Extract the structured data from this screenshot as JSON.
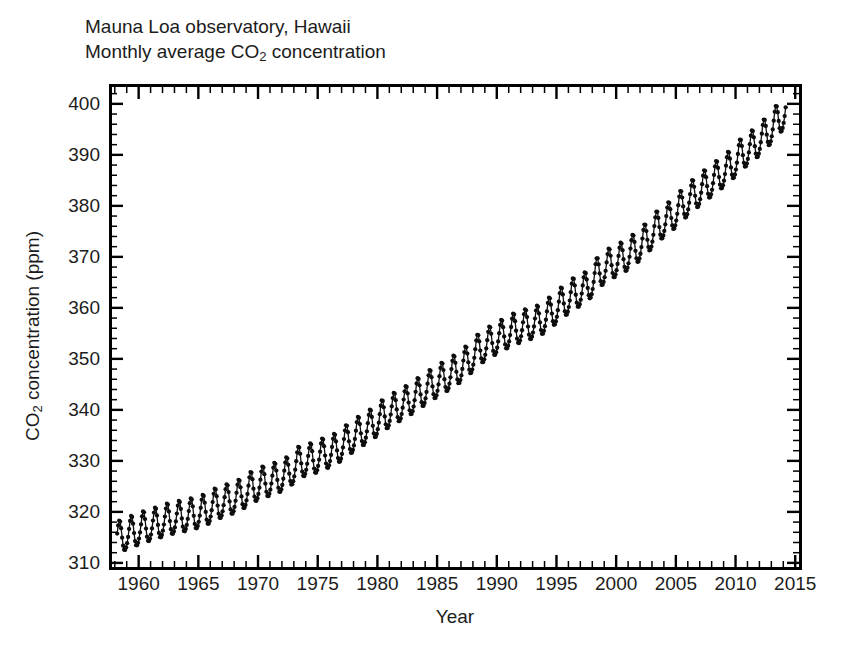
{
  "figure": {
    "title_lines": [
      "Mauna Loa observatory, Hawaii",
      "Monthly average CO2 concentration"
    ],
    "title_line_1": "Mauna Loa observatory, Hawaii",
    "title_line_2_prefix": "Monthly average CO",
    "title_line_2_sub": "2",
    "title_line_2_suffix": " concentration",
    "background_color": "#ffffff",
    "data_color": "#0d0d0d",
    "axis_color": "#000000"
  },
  "chart_data": {
    "type": "line",
    "xlabel": "Year",
    "ylabel": "CO2 concentration (ppm)",
    "ylabel_prefix": "CO",
    "ylabel_sub": "2",
    "ylabel_suffix": " concentration (ppm)",
    "xlim": [
      1957.6,
      2015.4
    ],
    "ylim": [
      309.0,
      403.5
    ],
    "grid": false,
    "legend": null,
    "marker": "filled-circle",
    "y_major_ticks": [
      310,
      320,
      330,
      340,
      350,
      360,
      370,
      380,
      390,
      400
    ],
    "y_tick_labels": [
      "310",
      "320",
      "330",
      "340",
      "350",
      "360",
      "370",
      "380",
      "390",
      "400"
    ],
    "y_minor_step": 2,
    "x_major_ticks": [
      1960,
      1965,
      1970,
      1975,
      1980,
      1985,
      1990,
      1995,
      2000,
      2005,
      2010,
      2015
    ],
    "x_tick_labels": [
      "1960",
      "1965",
      "1970",
      "1975",
      "1980",
      "1985",
      "1990",
      "1995",
      "2000",
      "2005",
      "2010",
      "2015"
    ],
    "x_minor_step": 1,
    "series_name": "Monthly average CO2",
    "annual_trend": [
      {
        "year": 1958.5,
        "value": 315.0
      },
      {
        "year": 1959.5,
        "value": 315.9
      },
      {
        "year": 1960.5,
        "value": 316.8
      },
      {
        "year": 1961.5,
        "value": 317.5
      },
      {
        "year": 1962.5,
        "value": 318.3
      },
      {
        "year": 1963.5,
        "value": 318.8
      },
      {
        "year": 1964.5,
        "value": 319.3
      },
      {
        "year": 1965.5,
        "value": 320.0
      },
      {
        "year": 1966.5,
        "value": 321.3
      },
      {
        "year": 1967.5,
        "value": 322.1
      },
      {
        "year": 1968.5,
        "value": 323.0
      },
      {
        "year": 1969.5,
        "value": 324.6
      },
      {
        "year": 1970.5,
        "value": 325.6
      },
      {
        "year": 1971.5,
        "value": 326.3
      },
      {
        "year": 1972.5,
        "value": 327.4
      },
      {
        "year": 1973.5,
        "value": 329.6
      },
      {
        "year": 1974.5,
        "value": 330.1
      },
      {
        "year": 1975.5,
        "value": 331.1
      },
      {
        "year": 1976.5,
        "value": 332.0
      },
      {
        "year": 1977.5,
        "value": 333.8
      },
      {
        "year": 1978.5,
        "value": 335.4
      },
      {
        "year": 1979.5,
        "value": 336.8
      },
      {
        "year": 1980.5,
        "value": 338.7
      },
      {
        "year": 1981.5,
        "value": 340.1
      },
      {
        "year": 1982.5,
        "value": 341.4
      },
      {
        "year": 1983.5,
        "value": 343.0
      },
      {
        "year": 1984.5,
        "value": 344.6
      },
      {
        "year": 1985.5,
        "value": 346.0
      },
      {
        "year": 1986.5,
        "value": 347.4
      },
      {
        "year": 1987.5,
        "value": 349.2
      },
      {
        "year": 1988.5,
        "value": 351.6
      },
      {
        "year": 1989.5,
        "value": 353.1
      },
      {
        "year": 1990.5,
        "value": 354.4
      },
      {
        "year": 1991.5,
        "value": 355.6
      },
      {
        "year": 1992.5,
        "value": 356.4
      },
      {
        "year": 1993.5,
        "value": 357.1
      },
      {
        "year": 1994.5,
        "value": 358.8
      },
      {
        "year": 1995.5,
        "value": 360.8
      },
      {
        "year": 1996.5,
        "value": 362.6
      },
      {
        "year": 1997.5,
        "value": 363.7
      },
      {
        "year": 1998.5,
        "value": 366.7
      },
      {
        "year": 1999.5,
        "value": 368.4
      },
      {
        "year": 2000.5,
        "value": 369.5
      },
      {
        "year": 2001.5,
        "value": 371.1
      },
      {
        "year": 2002.5,
        "value": 373.2
      },
      {
        "year": 2003.5,
        "value": 375.8
      },
      {
        "year": 2004.5,
        "value": 377.5
      },
      {
        "year": 2005.5,
        "value": 379.8
      },
      {
        "year": 2006.5,
        "value": 381.9
      },
      {
        "year": 2007.5,
        "value": 383.8
      },
      {
        "year": 2008.5,
        "value": 385.6
      },
      {
        "year": 2009.5,
        "value": 387.4
      },
      {
        "year": 2010.5,
        "value": 389.9
      },
      {
        "year": 2011.5,
        "value": 391.6
      },
      {
        "year": 2012.5,
        "value": 393.8
      },
      {
        "year": 2013.5,
        "value": 396.5
      },
      {
        "year": 2014.2,
        "value": 398.3
      }
    ],
    "seasonal": {
      "amplitude_ppm": 3.1,
      "peak_month": 5,
      "trough_month": 9,
      "description": "Monthly values oscillate about the annual trend with a ~6 ppm peak-to-trough seasonal cycle, maximum in May and minimum in late September."
    },
    "data_start": {
      "year": 1958.2,
      "value": 315.7
    },
    "data_end": {
      "year": 2014.2,
      "value": 398.3
    },
    "observed_min_ppm": 312.7,
    "observed_max_ppm": 401.3,
    "points_per_year": 12
  },
  "axis_title_x": "Year",
  "caption_sliver": ""
}
